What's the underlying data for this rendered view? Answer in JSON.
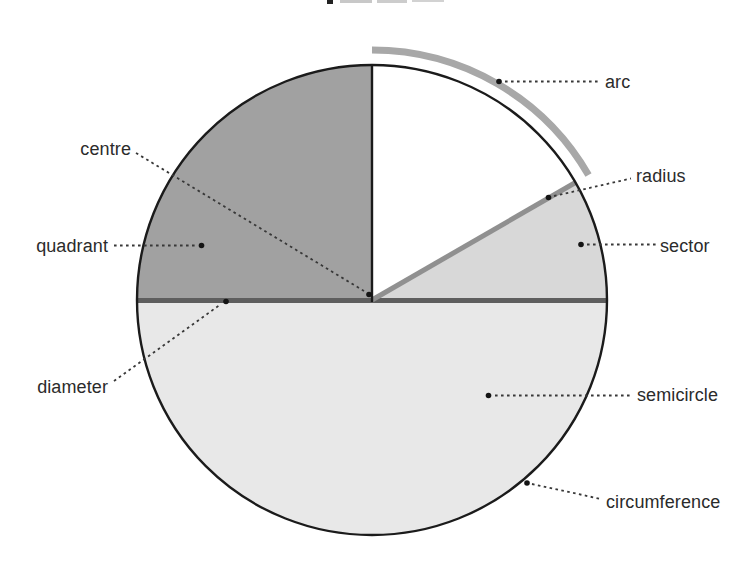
{
  "diagram": {
    "labels": {
      "arc": "arc",
      "radius": "radius",
      "sector": "sector",
      "semicircle": "semicircle",
      "circumference": "circumference",
      "centre": "centre",
      "quadrant": "quadrant",
      "diameter": "diameter"
    },
    "colors": {
      "background": "#ffffff",
      "quadrant_fill": "#a1a1a1",
      "sector_fill": "#d8d8d8",
      "semicircle_fill": "#e8e8e8",
      "circle_outline": "#1b1b1b",
      "diameter_line": "#5e5e5e",
      "radius_line": "#909090",
      "outer_arc": "#a8a8a8",
      "leader_line": "#383838",
      "marker_dot": "#141414",
      "label_text": "#2b2b2b",
      "cropped_title_ink": "#222222"
    }
  }
}
